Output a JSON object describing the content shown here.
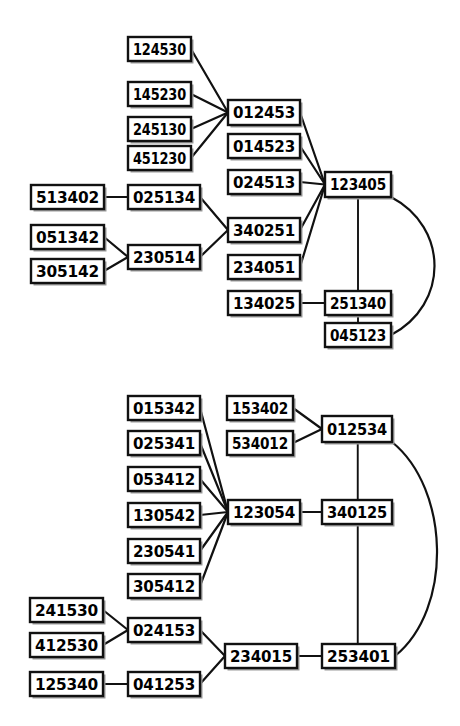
{
  "figure": {
    "title": "",
    "background_color": "#ffffff",
    "line_color": "#111111",
    "box_fill": "#ffffff",
    "box_stroke": "#111111"
  },
  "diagrams": [
    {
      "id": "upper-lattice",
      "name": "upper-permutation-lattice",
      "nodes": [
        {
          "id": "u1",
          "label": "124530",
          "x": 128,
          "y": 37,
          "w": 63,
          "h": 24
        },
        {
          "id": "u2",
          "label": "145230",
          "x": 128,
          "y": 82,
          "w": 63,
          "h": 24
        },
        {
          "id": "u3",
          "label": "245130",
          "x": 128,
          "y": 117,
          "w": 63,
          "h": 24
        },
        {
          "id": "u4",
          "label": "451230",
          "x": 128,
          "y": 146,
          "w": 63,
          "h": 24
        },
        {
          "id": "u5",
          "label": "513402",
          "x": 31,
          "y": 185,
          "w": 73,
          "h": 24
        },
        {
          "id": "u6",
          "label": "025134",
          "x": 128,
          "y": 185,
          "w": 72,
          "h": 24
        },
        {
          "id": "u7",
          "label": "051342",
          "x": 31,
          "y": 225,
          "w": 73,
          "h": 24
        },
        {
          "id": "u8",
          "label": "305142",
          "x": 31,
          "y": 259,
          "w": 73,
          "h": 24
        },
        {
          "id": "u9",
          "label": "230514",
          "x": 128,
          "y": 245,
          "w": 72,
          "h": 24
        },
        {
          "id": "u10",
          "label": "012453",
          "x": 228,
          "y": 100,
          "w": 72,
          "h": 25
        },
        {
          "id": "u11",
          "label": "014523",
          "x": 228,
          "y": 134,
          "w": 72,
          "h": 24
        },
        {
          "id": "u12",
          "label": "024513",
          "x": 228,
          "y": 170,
          "w": 72,
          "h": 24
        },
        {
          "id": "u13",
          "label": "340251",
          "x": 228,
          "y": 218,
          "w": 72,
          "h": 24
        },
        {
          "id": "u14",
          "label": "234051",
          "x": 228,
          "y": 255,
          "w": 72,
          "h": 24
        },
        {
          "id": "u15",
          "label": "134025",
          "x": 228,
          "y": 291,
          "w": 72,
          "h": 24
        },
        {
          "id": "u16",
          "label": "123405",
          "x": 325,
          "y": 172,
          "w": 66,
          "h": 25
        },
        {
          "id": "u17",
          "label": "251340",
          "x": 325,
          "y": 291,
          "w": 66,
          "h": 24
        },
        {
          "id": "u18",
          "label": "045123",
          "x": 325,
          "y": 323,
          "w": 66,
          "h": 24
        }
      ],
      "edges": [
        {
          "from": "u1",
          "to": "u10",
          "type": "line"
        },
        {
          "from": "u2",
          "to": "u10",
          "type": "line"
        },
        {
          "from": "u3",
          "to": "u10",
          "type": "line"
        },
        {
          "from": "u4",
          "to": "u10",
          "type": "line"
        },
        {
          "from": "u5",
          "to": "u6",
          "type": "line"
        },
        {
          "from": "u7",
          "to": "u9",
          "type": "line"
        },
        {
          "from": "u8",
          "to": "u9",
          "type": "line"
        },
        {
          "from": "u6",
          "to": "u13",
          "type": "line"
        },
        {
          "from": "u9",
          "to": "u13",
          "type": "line"
        },
        {
          "from": "u10",
          "to": "u16",
          "type": "line"
        },
        {
          "from": "u11",
          "to": "u16",
          "type": "line"
        },
        {
          "from": "u12",
          "to": "u16",
          "type": "line"
        },
        {
          "from": "u13",
          "to": "u16",
          "type": "line"
        },
        {
          "from": "u14",
          "to": "u16",
          "type": "line"
        },
        {
          "from": "u15",
          "to": "u17",
          "type": "line"
        },
        {
          "from": "u16",
          "to": "u17",
          "type": "vertical"
        },
        {
          "from": "u17",
          "to": "u18",
          "type": "vertical"
        },
        {
          "from": "u16",
          "to": "u18",
          "type": "curve"
        }
      ]
    },
    {
      "id": "lower-lattice",
      "name": "lower-permutation-lattice",
      "nodes": [
        {
          "id": "l1",
          "label": "015342",
          "x": 128,
          "y": 396,
          "w": 72,
          "h": 24
        },
        {
          "id": "l2",
          "label": "025341",
          "x": 128,
          "y": 431,
          "w": 72,
          "h": 24
        },
        {
          "id": "l3",
          "label": "053412",
          "x": 128,
          "y": 467,
          "w": 72,
          "h": 24
        },
        {
          "id": "l4",
          "label": "130542",
          "x": 128,
          "y": 503,
          "w": 72,
          "h": 24
        },
        {
          "id": "l5",
          "label": "230541",
          "x": 128,
          "y": 539,
          "w": 72,
          "h": 24
        },
        {
          "id": "l6",
          "label": "305412",
          "x": 128,
          "y": 574,
          "w": 72,
          "h": 24
        },
        {
          "id": "l7",
          "label": "241530",
          "x": 30,
          "y": 598,
          "w": 73,
          "h": 24
        },
        {
          "id": "l8",
          "label": "412530",
          "x": 30,
          "y": 633,
          "w": 73,
          "h": 24
        },
        {
          "id": "l9",
          "label": "125340",
          "x": 30,
          "y": 672,
          "w": 73,
          "h": 24
        },
        {
          "id": "l10",
          "label": "024153",
          "x": 128,
          "y": 618,
          "w": 72,
          "h": 24
        },
        {
          "id": "l11",
          "label": "041253",
          "x": 128,
          "y": 672,
          "w": 72,
          "h": 24
        },
        {
          "id": "l12",
          "label": "153402",
          "x": 227,
          "y": 396,
          "w": 66,
          "h": 24
        },
        {
          "id": "l13",
          "label": "534012",
          "x": 227,
          "y": 431,
          "w": 66,
          "h": 24
        },
        {
          "id": "l14",
          "label": "123054",
          "x": 228,
          "y": 500,
          "w": 72,
          "h": 24
        },
        {
          "id": "l15",
          "label": "234015",
          "x": 225,
          "y": 644,
          "w": 72,
          "h": 24
        },
        {
          "id": "l16",
          "label": "012534",
          "x": 322,
          "y": 416,
          "w": 70,
          "h": 26
        },
        {
          "id": "l17",
          "label": "340125",
          "x": 322,
          "y": 500,
          "w": 70,
          "h": 24
        },
        {
          "id": "l18",
          "label": "253401",
          "x": 322,
          "y": 644,
          "w": 73,
          "h": 24
        }
      ],
      "edges": [
        {
          "from": "l1",
          "to": "l14",
          "type": "line"
        },
        {
          "from": "l2",
          "to": "l14",
          "type": "line"
        },
        {
          "from": "l3",
          "to": "l14",
          "type": "line"
        },
        {
          "from": "l4",
          "to": "l14",
          "type": "line"
        },
        {
          "from": "l5",
          "to": "l14",
          "type": "line"
        },
        {
          "from": "l6",
          "to": "l14",
          "type": "line"
        },
        {
          "from": "l7",
          "to": "l10",
          "type": "line"
        },
        {
          "from": "l8",
          "to": "l10",
          "type": "line"
        },
        {
          "from": "l9",
          "to": "l11",
          "type": "line"
        },
        {
          "from": "l10",
          "to": "l15",
          "type": "line"
        },
        {
          "from": "l11",
          "to": "l15",
          "type": "line"
        },
        {
          "from": "l12",
          "to": "l16",
          "type": "line"
        },
        {
          "from": "l13",
          "to": "l16",
          "type": "line"
        },
        {
          "from": "l14",
          "to": "l17",
          "type": "line"
        },
        {
          "from": "l15",
          "to": "l18",
          "type": "line"
        },
        {
          "from": "l16",
          "to": "l18",
          "type": "vertical"
        },
        {
          "from": "l16",
          "to": "l18",
          "type": "curve"
        }
      ]
    }
  ]
}
